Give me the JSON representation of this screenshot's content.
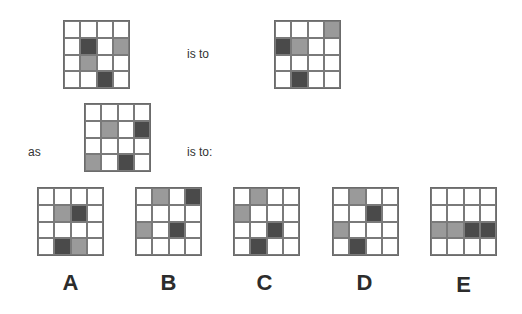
{
  "puzzle": {
    "text": {
      "is_to_1": "is to",
      "as": "as",
      "is_to_2": "is to:"
    },
    "colors": {
      "gray": "#9a9a9a",
      "dark": "#4a4a4a",
      "line": "#7a7a7a"
    },
    "grids": {
      "first": {
        "shaded": [
          {
            "r": 1,
            "c": 1,
            "t": "dark"
          },
          {
            "r": 1,
            "c": 3,
            "t": "gray"
          },
          {
            "r": 2,
            "c": 1,
            "t": "gray"
          },
          {
            "r": 3,
            "c": 2,
            "t": "dark"
          }
        ]
      },
      "second": {
        "shaded": [
          {
            "r": 0,
            "c": 3,
            "t": "gray"
          },
          {
            "r": 1,
            "c": 0,
            "t": "dark"
          },
          {
            "r": 1,
            "c": 1,
            "t": "gray"
          },
          {
            "r": 3,
            "c": 1,
            "t": "dark"
          }
        ]
      },
      "third": {
        "shaded": [
          {
            "r": 1,
            "c": 1,
            "t": "gray"
          },
          {
            "r": 1,
            "c": 3,
            "t": "dark"
          },
          {
            "r": 3,
            "c": 0,
            "t": "gray"
          },
          {
            "r": 3,
            "c": 2,
            "t": "dark"
          }
        ]
      }
    },
    "options": [
      {
        "label": "A",
        "shaded": [
          {
            "r": 1,
            "c": 1,
            "t": "gray"
          },
          {
            "r": 1,
            "c": 2,
            "t": "dark"
          },
          {
            "r": 3,
            "c": 1,
            "t": "dark"
          },
          {
            "r": 3,
            "c": 2,
            "t": "gray"
          }
        ]
      },
      {
        "label": "B",
        "shaded": [
          {
            "r": 0,
            "c": 1,
            "t": "gray"
          },
          {
            "r": 0,
            "c": 3,
            "t": "dark"
          },
          {
            "r": 2,
            "c": 0,
            "t": "gray"
          },
          {
            "r": 2,
            "c": 2,
            "t": "dark"
          }
        ]
      },
      {
        "label": "C",
        "shaded": [
          {
            "r": 0,
            "c": 1,
            "t": "gray"
          },
          {
            "r": 1,
            "c": 0,
            "t": "gray"
          },
          {
            "r": 2,
            "c": 2,
            "t": "dark"
          },
          {
            "r": 3,
            "c": 1,
            "t": "dark"
          }
        ]
      },
      {
        "label": "D",
        "shaded": [
          {
            "r": 0,
            "c": 1,
            "t": "gray"
          },
          {
            "r": 1,
            "c": 2,
            "t": "dark"
          },
          {
            "r": 2,
            "c": 0,
            "t": "gray"
          },
          {
            "r": 3,
            "c": 1,
            "t": "dark"
          }
        ]
      },
      {
        "label": "E",
        "shaded": [
          {
            "r": 2,
            "c": 0,
            "t": "gray"
          },
          {
            "r": 2,
            "c": 1,
            "t": "gray"
          },
          {
            "r": 2,
            "c": 2,
            "t": "dark"
          },
          {
            "r": 2,
            "c": 3,
            "t": "dark"
          }
        ]
      }
    ]
  }
}
